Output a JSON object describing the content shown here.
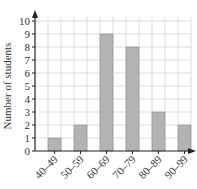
{
  "chart_data": {
    "type": "bar",
    "title": "",
    "xlabel": "",
    "ylabel": "Number of students",
    "categories": [
      "40–49",
      "50–59",
      "60–69",
      "70–79",
      "80–89",
      "90–99"
    ],
    "values": [
      1,
      2,
      9,
      8,
      3,
      2
    ],
    "ylim": [
      0,
      10
    ],
    "yticks": [
      0,
      1,
      2,
      3,
      4,
      5,
      6,
      7,
      8,
      9,
      10
    ],
    "grid": true,
    "legend": null,
    "bar_color": "#b3b3b3",
    "bar_edge_color": "#8a8a8a",
    "grid_color": "#d6d6d6",
    "axis_color": "#222222"
  }
}
